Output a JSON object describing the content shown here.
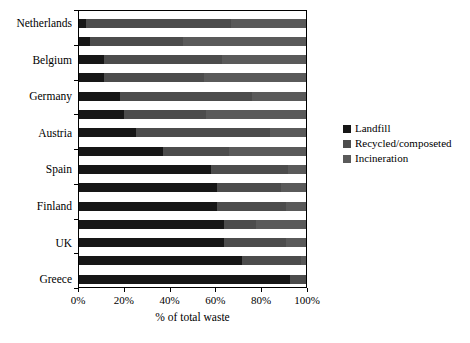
{
  "chart_data": {
    "type": "bar",
    "orientation": "horizontal",
    "stacked": true,
    "title": "",
    "xlabel": "% of total waste",
    "xlim": [
      0,
      100
    ],
    "x_ticks": [
      "0%",
      "20%",
      "40%",
      "60%",
      "80%",
      "100%"
    ],
    "grid": false,
    "legend_position": "right",
    "categories": [
      "Netherlands",
      "",
      "Belgium",
      "",
      "Germany",
      "",
      "Austria",
      "",
      "Spain",
      "",
      "Finland",
      "",
      "UK",
      "",
      "Greece"
    ],
    "series": [
      {
        "name": "Landfill",
        "color": "#161616",
        "values": [
          3,
          5,
          11,
          11,
          18,
          20,
          25,
          37,
          58,
          61,
          61,
          64,
          64,
          72,
          93
        ]
      },
      {
        "name": "Recycled/composeted",
        "color": "#4c4c4c",
        "values": [
          64,
          41,
          52,
          44,
          58,
          36,
          59,
          29,
          34,
          28,
          30,
          14,
          27,
          26,
          7
        ]
      },
      {
        "name": "Incineration",
        "color": "#5a5a5a",
        "values": [
          33,
          54,
          37,
          45,
          24,
          44,
          16,
          34,
          8,
          11,
          9,
          22,
          9,
          2,
          0
        ]
      }
    ]
  },
  "layout_note": ""
}
